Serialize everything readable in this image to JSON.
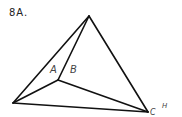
{
  "figure": {
    "label": "8A.",
    "vertices": {
      "apex": [
        89,
        16
      ],
      "left": [
        13,
        103
      ],
      "right": [
        148,
        112
      ],
      "interior": [
        58,
        80
      ]
    },
    "edges": [
      [
        "apex",
        "left"
      ],
      [
        "apex",
        "interior"
      ],
      [
        "apex",
        "right"
      ],
      [
        "left",
        "right"
      ],
      [
        "left",
        "interior"
      ],
      [
        "interior",
        "right"
      ]
    ],
    "labels": {
      "A": "A",
      "B": "B",
      "C": "C",
      "H": "H"
    }
  }
}
